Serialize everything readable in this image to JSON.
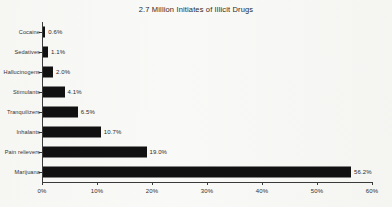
{
  "chart_data": {
    "type": "bar",
    "orientation": "horizontal",
    "title": "2.7 Million Initiates of Illicit Drugs",
    "xlabel": "",
    "ylabel": "",
    "xlim": [
      0,
      60
    ],
    "grid": false,
    "legend": null,
    "categories": [
      "Cocaine",
      "Sedatives",
      "Hallucinogens",
      "Stimulants",
      "Tranquilizers",
      "Inhalants",
      "Pain relievers",
      "Marijuana"
    ],
    "values": [
      0.6,
      1.1,
      2.0,
      4.1,
      6.5,
      10.7,
      19.0,
      56.2
    ],
    "data_labels": [
      "0.6%",
      "1.1%",
      "2.0%",
      "4.1%",
      "6.5%",
      "10.7%",
      "19.0%",
      "56.2%"
    ],
    "xticks": [
      0,
      10,
      20,
      30,
      40,
      50,
      60
    ],
    "xtick_labels": [
      "0%",
      "10%",
      "20%",
      "30%",
      "40%",
      "50%",
      "60%"
    ],
    "bar_color": "#111111",
    "background_color": "#f7f7f5",
    "axis_color": "#3a3a3a"
  }
}
